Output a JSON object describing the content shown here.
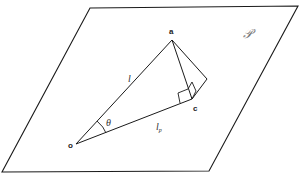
{
  "diagram": {
    "plane_label": "𝒫",
    "points": {
      "a": "a",
      "c": "c",
      "o": "o"
    },
    "edge_labels": {
      "oa": "l",
      "oc_main": "l",
      "oc_sub": "p"
    },
    "angle_label": "θ",
    "colors": {
      "line": "#1a1a1a",
      "background": "#ffffff"
    }
  }
}
